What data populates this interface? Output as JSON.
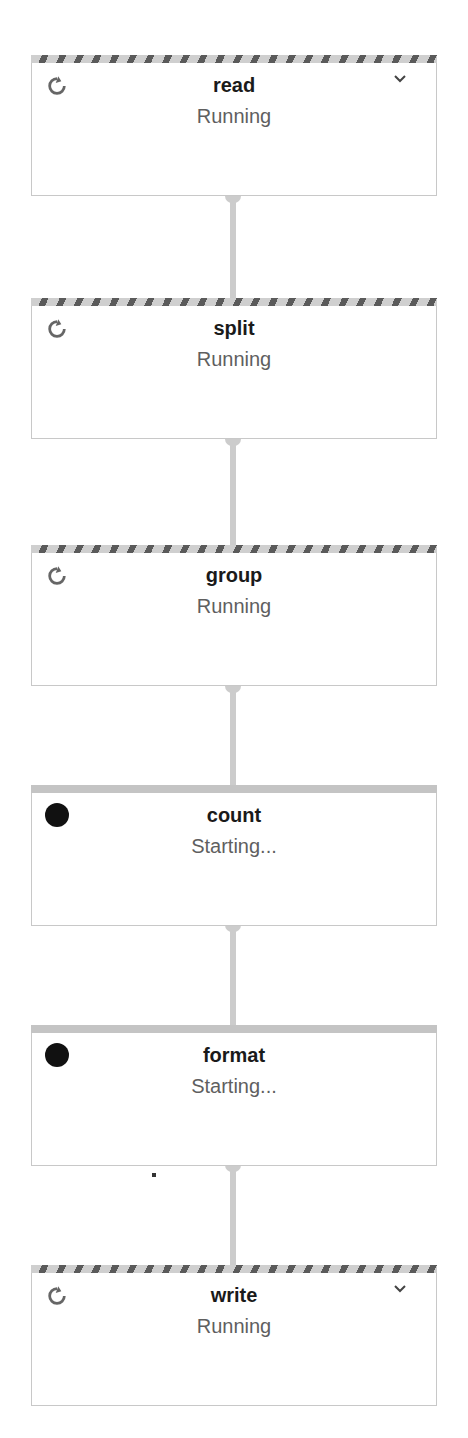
{
  "graph": {
    "nodes": [
      {
        "name": "read",
        "status": "Running",
        "state": "running",
        "expandable": true,
        "top": 55
      },
      {
        "name": "split",
        "status": "Running",
        "state": "running",
        "expandable": false,
        "top": 298
      },
      {
        "name": "group",
        "status": "Running",
        "state": "running",
        "expandable": false,
        "top": 545
      },
      {
        "name": "count",
        "status": "Starting...",
        "state": "starting",
        "expandable": false,
        "top": 785
      },
      {
        "name": "format",
        "status": "Starting...",
        "state": "starting",
        "expandable": false,
        "top": 1025
      },
      {
        "name": "write",
        "status": "Running",
        "state": "running",
        "expandable": true,
        "top": 1265
      }
    ],
    "edges": [
      {
        "from": "read",
        "to": "split"
      },
      {
        "from": "split",
        "to": "group"
      },
      {
        "from": "group",
        "to": "count"
      },
      {
        "from": "count",
        "to": "format"
      },
      {
        "from": "format",
        "to": "write"
      }
    ],
    "icons": {
      "running": "refresh-icon",
      "starting": "filled-circle-icon",
      "expand": "chevron-down-icon"
    },
    "colors": {
      "stripe_dark": "#5a5a5a",
      "stripe_light": "#cfcfcf",
      "edge": "#cccccc",
      "title": "#1a1a1a",
      "status": "#5f5f5f"
    }
  }
}
